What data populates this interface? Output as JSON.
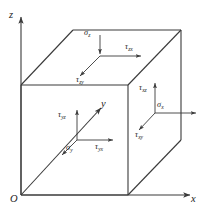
{
  "figure": {
    "background_color": "#ffffff",
    "line_color": "#3a3a3a",
    "text_color": "#1c1c1c"
  },
  "axes": {
    "z": {
      "label": "z",
      "direction": "up",
      "origin_label": "O"
    },
    "x": {
      "label": "x",
      "direction": "right"
    },
    "y": {
      "label": "y",
      "direction": "diagonal-up-right"
    },
    "origin": {
      "label": "O"
    }
  },
  "faces": [
    {
      "name": "top-face",
      "normal": "z",
      "components": [
        {
          "id": "sigma-z",
          "symbol": "σ",
          "subscript": "z",
          "direction": "down"
        },
        {
          "id": "tau-zx",
          "symbol": "τ",
          "subscript": "zx",
          "direction": "right"
        },
        {
          "id": "tau-zy",
          "symbol": "τ",
          "subscript": "zy",
          "direction": "down-left"
        }
      ]
    },
    {
      "name": "front-left-face",
      "normal": "y",
      "components": [
        {
          "id": "sigma-y",
          "symbol": "σ",
          "subscript": "y",
          "direction": "down-left"
        },
        {
          "id": "tau-yz",
          "symbol": "τ",
          "subscript": "yz",
          "direction": "up"
        },
        {
          "id": "tau-yx",
          "symbol": "τ",
          "subscript": "yx",
          "direction": "right"
        }
      ]
    },
    {
      "name": "right-face",
      "normal": "x",
      "components": [
        {
          "id": "sigma-x",
          "symbol": "σ",
          "subscript": "x",
          "direction": "right"
        },
        {
          "id": "tau-xz",
          "symbol": "τ",
          "subscript": "xz",
          "direction": "up"
        },
        {
          "id": "tau-xy",
          "symbol": "τ",
          "subscript": "xy",
          "direction": "down-left"
        }
      ]
    }
  ],
  "labels": {
    "axis_z": "z",
    "axis_x": "x",
    "axis_y": "y",
    "origin": "O",
    "sigma_z": "σ",
    "sigma_z_sub": "z",
    "tau_zx": "τ",
    "tau_zx_sub": "zx",
    "tau_zy": "τ",
    "tau_zy_sub": "zy",
    "sigma_y": "σ",
    "sigma_y_sub": "y",
    "tau_yz": "τ",
    "tau_yz_sub": "yz",
    "tau_yx": "τ",
    "tau_yx_sub": "yx",
    "sigma_x": "σ",
    "sigma_x_sub": "x",
    "tau_xz": "τ",
    "tau_xz_sub": "xz",
    "tau_xy": "τ",
    "tau_xy_sub": "xy"
  }
}
